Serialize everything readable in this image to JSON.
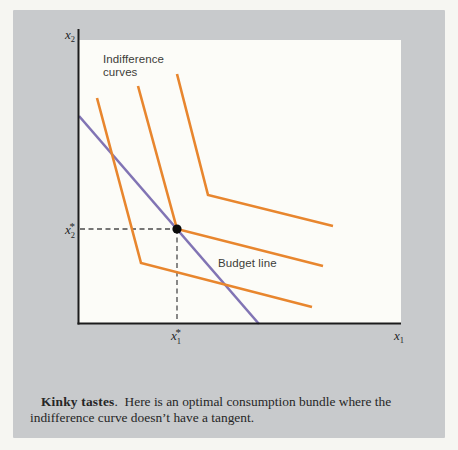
{
  "card": {
    "background": "#c8cacc",
    "plot_background": "#fcfcf8"
  },
  "figure_labels": {
    "indifference_line1": "Indifference",
    "indifference_line2": "curves",
    "budget_line": "Budget line",
    "y_axis": {
      "base": "x",
      "sub": "2"
    },
    "x_axis": {
      "base": "x",
      "sub": "1"
    },
    "optimal_y": {
      "base": "x",
      "sub": "2",
      "star": "*"
    },
    "optimal_x": {
      "base": "x",
      "sub": "1",
      "star": "*"
    }
  },
  "chart_data": {
    "type": "line",
    "title": "Kinky tastes",
    "axes": {
      "x_label": "x1",
      "y_label": "x2",
      "plot_rect_px": {
        "x": 79,
        "y": 40,
        "width": 322,
        "height": 283
      },
      "y_axis_px": {
        "x": 78.5,
        "y_top": 29,
        "y_bottom": 324.5
      },
      "x_axis_px": {
        "y": 323.5,
        "x_left": 77.5,
        "x_right": 401
      }
    },
    "series": [
      {
        "name": "indifference-curve-1",
        "color": "#e8862e",
        "width": 2.6,
        "points_px": [
          [
            97,
            98
          ],
          [
            141,
            263
          ],
          [
            312,
            307
          ]
        ]
      },
      {
        "name": "indifference-curve-2",
        "color": "#e8862e",
        "width": 2.6,
        "points_px": [
          [
            138,
            86
          ],
          [
            177,
            229
          ],
          [
            323,
            266
          ]
        ]
      },
      {
        "name": "indifference-curve-3",
        "color": "#e8862e",
        "width": 2.6,
        "points_px": [
          [
            177,
            74
          ],
          [
            208,
            195
          ],
          [
            333,
            226
          ]
        ]
      },
      {
        "name": "budget-line",
        "color": "#8174b4",
        "width": 2.6,
        "points_px": [
          [
            79,
            116
          ],
          [
            259,
            324
          ]
        ]
      }
    ],
    "optimal_bundle_px": [
      177,
      229
    ],
    "optimal_bundle_labels": {
      "x": "x1*",
      "y": "x2*"
    },
    "guides": {
      "color": "#4a4a4a",
      "dash": "5 3.5",
      "width": 1.3,
      "to_x_axis_y_px": 322,
      "to_y_axis_x_px": 80
    },
    "point_style": {
      "color": "#0a0a0a",
      "radius": 4.6
    },
    "legend": "none",
    "grid": false
  },
  "caption": {
    "lead": "Kinky tastes",
    "period": ".",
    "gap": "  ",
    "body": "Here is an optimal consumption bundle where the indifference curve doesn’t have a tangent."
  }
}
